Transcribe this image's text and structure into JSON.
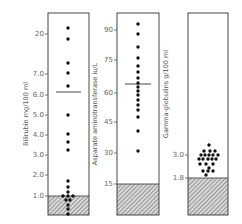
{
  "chart_data": [
    {
      "type": "scatter",
      "title": "",
      "ylabel": "Bilirubin mg/100 ml",
      "yticks": [
        "1.0",
        "2.0",
        "3.0",
        "4.0",
        "5.0",
        "6.0",
        "7.0",
        "20"
      ],
      "normal_upper_limit": 1.0,
      "median": 6.1,
      "values": [
        21,
        18,
        9,
        7.0,
        6.4,
        5.0,
        4.1,
        3.7,
        3.3,
        1.7,
        1.5,
        1.3,
        1.1,
        1.05,
        1.05,
        1.0,
        0.8,
        0.7,
        0.5,
        0.3
      ],
      "panel": {
        "x0": 48,
        "x1": 89,
        "top": 13,
        "bottom": 215,
        "ticks": [
          {
            "label": "20",
            "y": 34
          },
          {
            "label": "7.0",
            "y": 74
          },
          {
            "label": "6.0",
            "y": 95
          },
          {
            "label": "5.0",
            "y": 115
          },
          {
            "label": "4.0",
            "y": 135
          },
          {
            "label": "3.0",
            "y": 155
          },
          {
            "label": "2.0",
            "y": 175
          },
          {
            "label": "1.0",
            "y": 196
          }
        ],
        "hatch_top": 196,
        "median_y": 92,
        "dots": [
          [
            68,
            28
          ],
          [
            68,
            39
          ],
          [
            68,
            63
          ],
          [
            68,
            73
          ],
          [
            68,
            86
          ],
          [
            68,
            115
          ],
          [
            68,
            134
          ],
          [
            68,
            142
          ],
          [
            68,
            150
          ],
          [
            68,
            181
          ],
          [
            68,
            187
          ],
          [
            68,
            192
          ],
          [
            63,
            196
          ],
          [
            68,
            196
          ],
          [
            73,
            196
          ],
          [
            66,
            200
          ],
          [
            70,
            200
          ],
          [
            68,
            205
          ],
          [
            68,
            209
          ],
          [
            68,
            214
          ]
        ]
      }
    },
    {
      "type": "scatter",
      "title": "",
      "ylabel": "Asparate aminotransferase iu/L",
      "yticks": [
        "15",
        "30",
        "45",
        "60",
        "75",
        "90"
      ],
      "normal_upper_limit": 15,
      "median": 64,
      "values": [
        93,
        88,
        82,
        76,
        72,
        69,
        66,
        64,
        62,
        60,
        58,
        56,
        53,
        51,
        47,
        40,
        31
      ],
      "panel": {
        "x0": 117,
        "x1": 159,
        "top": 13,
        "bottom": 215,
        "ticks": [
          {
            "label": "90",
            "y": 30
          },
          {
            "label": "75",
            "y": 60
          },
          {
            "label": "60",
            "y": 93
          },
          {
            "label": "45",
            "y": 122
          },
          {
            "label": "30",
            "y": 153
          },
          {
            "label": "15",
            "y": 184
          }
        ],
        "hatch_top": 184,
        "median_y": 84,
        "dots": [
          [
            138,
            24
          ],
          [
            138,
            34
          ],
          [
            138,
            47
          ],
          [
            138,
            58
          ],
          [
            138,
            66
          ],
          [
            138,
            72
          ],
          [
            138,
            78
          ],
          [
            138,
            83
          ],
          [
            138,
            87
          ],
          [
            138,
            91
          ],
          [
            138,
            95
          ],
          [
            138,
            100
          ],
          [
            138,
            105
          ],
          [
            138,
            110
          ],
          [
            138,
            117
          ],
          [
            138,
            131
          ],
          [
            138,
            151
          ]
        ]
      }
    },
    {
      "type": "scatter",
      "title": "",
      "ylabel": "Gamma-globulins g/100 ml",
      "yticks": [
        "1.8",
        "3.0"
      ],
      "normal_upper_limit": 1.8,
      "values": [
        3.5,
        3.2,
        3.2,
        3.1,
        3.1,
        3.0,
        3.0,
        3.0,
        3.0,
        3.0,
        2.9,
        2.9,
        2.8,
        2.7,
        2.6,
        2.5,
        2.4,
        2.4,
        2.2,
        2.1,
        2.1,
        2.1
      ],
      "panel": {
        "x0": 188,
        "x1": 228,
        "top": 13,
        "bottom": 215,
        "ticks": [
          {
            "label": "3.0",
            "y": 155
          },
          {
            "label": "1.8",
            "y": 178
          }
        ],
        "hatch_top": 178,
        "dots": [
          [
            209,
            145
          ],
          [
            204,
            151
          ],
          [
            210,
            151
          ],
          [
            215,
            151
          ],
          [
            201,
            155
          ],
          [
            205,
            155
          ],
          [
            209,
            155
          ],
          [
            213,
            155
          ],
          [
            218,
            155
          ],
          [
            199,
            159
          ],
          [
            203,
            159
          ],
          [
            208,
            159
          ],
          [
            212,
            159
          ],
          [
            216,
            159
          ],
          [
            200,
            164
          ],
          [
            206,
            164
          ],
          [
            213,
            164
          ],
          [
            209,
            168
          ],
          [
            203,
            171
          ],
          [
            208,
            171
          ],
          [
            213,
            171
          ],
          [
            206,
            175
          ]
        ]
      }
    }
  ]
}
